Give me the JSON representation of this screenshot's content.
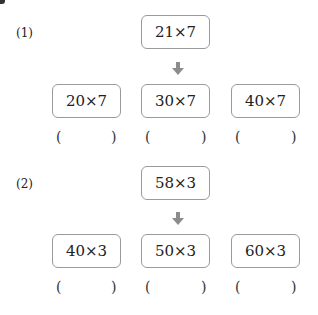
{
  "problems": [
    {
      "label": "(1)",
      "top": "21×7",
      "options": [
        "20×7",
        "30×7",
        "40×7"
      ],
      "answer_open": "(",
      "answer_close": ")"
    },
    {
      "label": "(2)",
      "top": "58×3",
      "options": [
        "40×3",
        "50×3",
        "60×3"
      ],
      "answer_open": "(",
      "answer_close": ")"
    }
  ],
  "colors": {
    "box_border": "#9a9a9a",
    "arrow": "#8c8c8c",
    "text": "#222222"
  }
}
